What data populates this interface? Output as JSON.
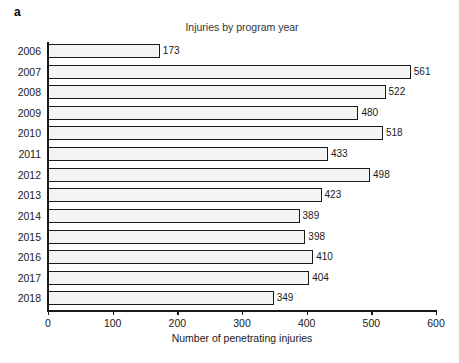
{
  "panel": {
    "letter": "a"
  },
  "axis_title": {
    "x": "Number of penetrating injuries"
  },
  "chart_data": {
    "type": "bar",
    "orientation": "horizontal",
    "title": "Injuries by program year",
    "xlabel": "Number of penetrating injuries",
    "ylabel": "",
    "categories": [
      "2006",
      "2007",
      "2008",
      "2009",
      "2010",
      "2011",
      "2012",
      "2013",
      "2014",
      "2015",
      "2016",
      "2017",
      "2018"
    ],
    "values": [
      173,
      561,
      522,
      480,
      518,
      433,
      498,
      423,
      389,
      398,
      410,
      404,
      349
    ],
    "data_labels": [
      "173",
      "561",
      "522",
      "480",
      "518",
      "433",
      "498",
      "423",
      "389",
      "398",
      "410",
      "404",
      "349"
    ],
    "xlim": [
      0,
      600
    ],
    "xticks": [
      0,
      100,
      200,
      300,
      400,
      500,
      600
    ],
    "xtick_labels": [
      "0",
      "100",
      "200",
      "300",
      "400",
      "500",
      "600"
    ],
    "grid": false,
    "legend": null,
    "bar_fill_color": "#f4f4f4",
    "bar_edge_color": "#1a1a1a",
    "background_color": "#ffffff"
  }
}
